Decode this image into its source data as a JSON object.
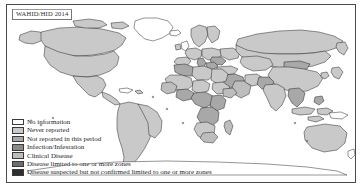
{
  "figure": {
    "type": "world-choropleth-map",
    "source_label": "WAHID/HID 2014",
    "background_color": "#ffffff",
    "frame_color": "#4a4a4a",
    "ocean_color": "#ffffff",
    "border_color": "#111111"
  },
  "legend": {
    "title": "",
    "position": "bottom-left",
    "items": [
      {
        "label": "No information",
        "color": "#ffffff"
      },
      {
        "label": "Never reported",
        "color": "#c9c9c9"
      },
      {
        "label": "Not reported in this period",
        "color": "#a8a8a8"
      },
      {
        "label": "Infection/Infestation",
        "color": "#8a8a8a"
      },
      {
        "label": "Clinical Disease",
        "color": "#bdbdbd"
      },
      {
        "label": "Disease limited to one or more zones",
        "color": "#6e6e6e"
      },
      {
        "label": "Disease suspected but not confirmed limited to one or more zones",
        "color": "#2e2e2e"
      }
    ]
  },
  "map_regions": {
    "no_information": [
      "Western Sahara",
      "Papua New Guinea",
      "Greenland interior"
    ],
    "never_reported": [
      "Canada",
      "United States",
      "Mexico",
      "Brazil",
      "Argentina",
      "Russia",
      "Australia",
      "China",
      "Kazakhstan",
      "France",
      "Spain",
      "Sweden",
      "Norway",
      "Mongolia",
      "Saudi Arabia",
      "Iran",
      "Algeria",
      "Libya",
      "Egypt",
      "Sudan",
      "Chad",
      "Niger",
      "Mali",
      "Angola",
      "South Africa",
      "Peru",
      "Colombia",
      "Venezuela",
      "Bolivia",
      "Chile",
      "India",
      "Indonesia",
      "Japan",
      "Turkey",
      "Ukraine",
      "Poland",
      "Germany",
      "Finland"
    ],
    "not_reported_this_period": [
      "Nigeria",
      "Ethiopia",
      "Kenya",
      "Tanzania",
      "Democratic Republic of the Congo",
      "Mozambique",
      "Zambia",
      "Namibia",
      "Botswana",
      "Morocco",
      "Tunisia",
      "Italy",
      "Romania",
      "Uzbekistan",
      "Afghanistan",
      "Pakistan",
      "Myanmar",
      "Thailand",
      "Vietnam",
      "Philippines"
    ],
    "clinical_disease": [
      "Senegal",
      "Guinea",
      "Ghana",
      "Cameroon",
      "Somalia",
      "Zimbabwe",
      "Madagascar",
      "Syria",
      "Iraq",
      "Yemen"
    ]
  }
}
